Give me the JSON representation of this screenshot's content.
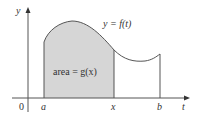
{
  "diagram": {
    "axis_labels": {
      "y": "y",
      "t": "t",
      "origin": "0"
    },
    "tick_labels": {
      "a": "a",
      "x": "x",
      "b": "b"
    },
    "curve_label": "y = f(t)",
    "area_label": "area = g(x)",
    "colors": {
      "fill": "#d6d6d6",
      "line": "#555555",
      "text": "#333333"
    }
  }
}
